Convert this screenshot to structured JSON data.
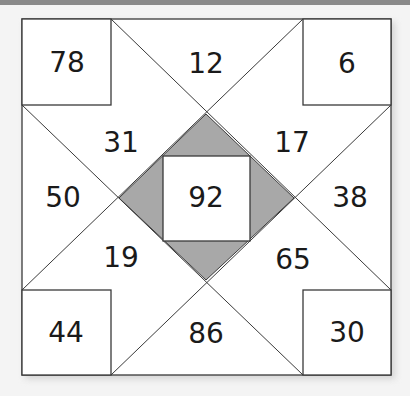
{
  "puzzle": {
    "colors": {
      "background": "#f4f4f4",
      "cell_fill": "#ffffff",
      "shaded_fill": "#a8a8a8",
      "line": "#3a3a3a",
      "top_band": "#8a8a8a"
    },
    "numbers": {
      "top_left": "78",
      "top_middle": "12",
      "top_right": "6",
      "upper_left_inner": "31",
      "upper_right_inner": "17",
      "middle_left": "50",
      "center": "92",
      "middle_right": "38",
      "lower_left_inner": "19",
      "lower_right_inner": "65",
      "bottom_left": "44",
      "bottom_middle": "86",
      "bottom_right": "30"
    }
  }
}
